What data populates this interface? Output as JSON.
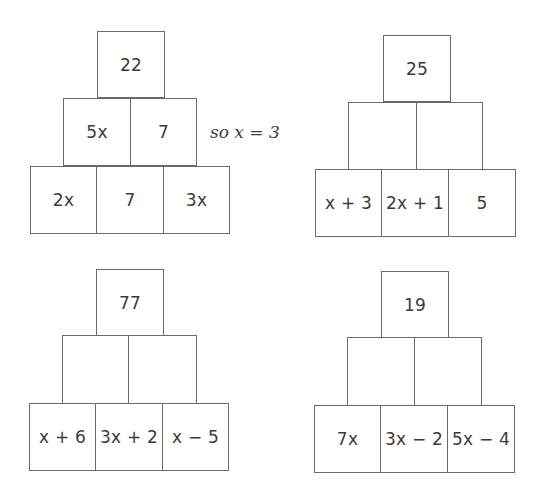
{
  "pyramids": [
    {
      "top": "22",
      "middle": [
        "5x",
        "7"
      ],
      "bottom": [
        "2x",
        "7",
        "3x"
      ],
      "annotation": "so x = 3"
    },
    {
      "top": "25",
      "middle": [
        "",
        ""
      ],
      "bottom": [
        "x + 3",
        "2x + 1",
        "5"
      ]
    },
    {
      "top": "77",
      "middle": [
        "",
        ""
      ],
      "bottom": [
        "x + 6",
        "3x + 2",
        "x − 5"
      ]
    },
    {
      "top": "19",
      "middle": [
        "",
        ""
      ],
      "bottom": [
        "7x",
        "3x − 2",
        "5x − 4"
      ]
    }
  ]
}
